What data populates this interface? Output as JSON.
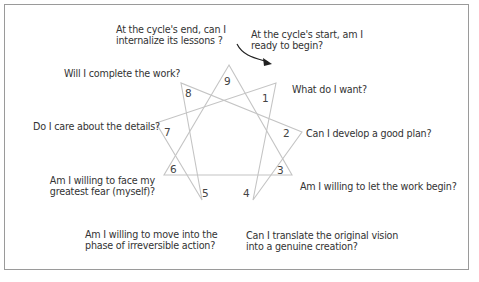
{
  "diagram": {
    "type": "enneagram",
    "points": [
      {
        "n": "1",
        "question": "What do I want?"
      },
      {
        "n": "2",
        "question": "Can I develop a good plan?"
      },
      {
        "n": "3",
        "question": "Am I willing to let the work begin?"
      },
      {
        "n": "4",
        "question_l1": "Can I translate the original vision",
        "question_l2": "into a genuine creation?"
      },
      {
        "n": "5",
        "question_l1": "Am I willing to move into the",
        "question_l2": "phase of irreversible action?"
      },
      {
        "n": "6",
        "question_l1": "Am I willing to face my",
        "question_l2": "greatest fear (myself)?"
      },
      {
        "n": "7",
        "question": "Do I care about the details?"
      },
      {
        "n": "8",
        "question": "Will I complete the work?"
      },
      {
        "n": "9",
        "question_l1": "At the cycle's end, can I",
        "question_l2": "internalize its lessons ?"
      }
    ],
    "start_note": {
      "l1": "At the cycle's start, am I",
      "l2": "ready to begin?"
    },
    "colors": {
      "lines": "#c8c8c8",
      "arrow": "#222222",
      "text": "#333333",
      "border": "#9a9a9a"
    }
  }
}
